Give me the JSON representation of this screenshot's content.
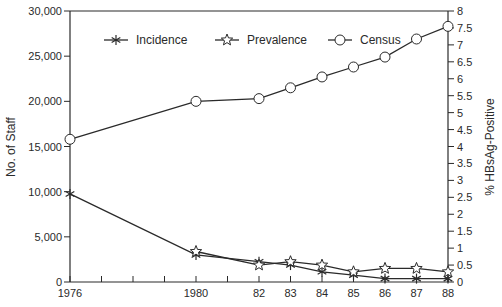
{
  "chart_data": {
    "type": "line",
    "title": "",
    "xlabel": "",
    "x": [
      1976,
      1980,
      1982,
      1983,
      1984,
      1985,
      1986,
      1987,
      1988
    ],
    "x_tick_labels": [
      "1976",
      "1980",
      "82",
      "83",
      "84",
      "85",
      "86",
      "87",
      "88"
    ],
    "x_minor_ticks": [
      1977,
      1978,
      1979,
      1981
    ],
    "xlim": [
      1976,
      1988
    ],
    "left_axis": {
      "label": "No. of Staff",
      "ylim": [
        0,
        30000
      ],
      "ticks": [
        0,
        5000,
        10000,
        15000,
        20000,
        25000,
        30000
      ],
      "tick_labels": [
        "0",
        "5,000",
        "10,000",
        "15,000",
        "20,000",
        "25,000",
        "30,000"
      ]
    },
    "right_axis": {
      "label": "% HBsAg-Positive",
      "ylim": [
        0,
        8
      ],
      "ticks": [
        0,
        0.5,
        1,
        1.5,
        2,
        2.5,
        3,
        3.5,
        4,
        4.5,
        5,
        5.5,
        6,
        6.5,
        7,
        7.5,
        8
      ],
      "tick_labels": [
        "0",
        "0.5",
        "1",
        "1.5",
        "2",
        "2.5",
        "3",
        "3.5",
        "4",
        "4.5",
        "5",
        "5.5",
        "6",
        "6.5",
        "7",
        "7.5",
        "8"
      ]
    },
    "series": [
      {
        "name": "Incidence",
        "axis": "right",
        "marker": "asterisk",
        "x": [
          1976,
          1980,
          1982,
          1983,
          1984,
          1985,
          1986,
          1987,
          1988
        ],
        "values": [
          2.6,
          0.8,
          0.6,
          0.5,
          0.3,
          0.2,
          0.1,
          0.1,
          0.1
        ]
      },
      {
        "name": "Prevalence",
        "axis": "right",
        "marker": "star",
        "x": [
          1980,
          1982,
          1983,
          1984,
          1985,
          1986,
          1987,
          1988
        ],
        "values": [
          0.9,
          0.5,
          0.6,
          0.5,
          0.3,
          0.4,
          0.4,
          0.3
        ]
      },
      {
        "name": "Census",
        "axis": "left",
        "marker": "circle",
        "x": [
          1976,
          1980,
          1982,
          1983,
          1984,
          1985,
          1986,
          1987,
          1988
        ],
        "values": [
          15800,
          20000,
          20300,
          21500,
          22700,
          23800,
          24900,
          26900,
          28300
        ]
      }
    ],
    "legend": {
      "position": "top-inside",
      "entries": [
        "Incidence",
        "Prevalence",
        "Census"
      ]
    },
    "grid": false,
    "colors": {
      "line": "#2a2a2a",
      "background": "#ffffff"
    }
  }
}
